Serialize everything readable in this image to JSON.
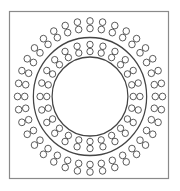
{
  "diagram": {
    "frame": {
      "x": 9.5,
      "y": 11.5,
      "width": 159,
      "height": 167,
      "stroke": "#8a8a8a"
    },
    "center": {
      "x": 90,
      "y": 96.5
    },
    "scale_x": 0.96,
    "stroke_color": "#444444",
    "inner_circle": {
      "r": 39.5
    },
    "middle_circle": {
      "r": 59
    },
    "inner_ring": {
      "count": 24,
      "r1": 45,
      "r2": 52,
      "small_r": 3.3,
      "offset_deg": 0
    },
    "outer_ring": {
      "count": 36,
      "r1": 68,
      "r2": 75.5,
      "small_r": 3.4,
      "offset_deg": 0
    }
  }
}
